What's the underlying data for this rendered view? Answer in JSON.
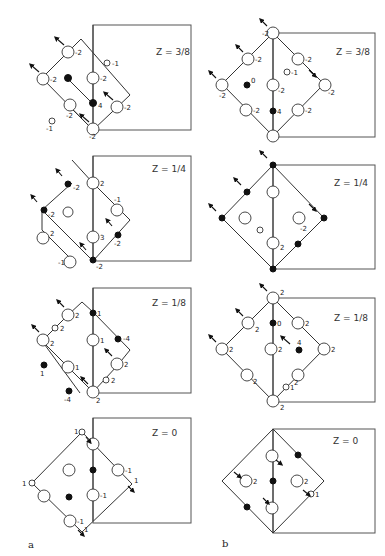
{
  "figure": {
    "panel_labels": [
      "a",
      "b"
    ],
    "panels": {
      "a": [
        {
          "z_label": "Z = 3/8",
          "level": "3/8",
          "open_site_values": [
            "-2",
            "-2",
            "-2",
            "-2",
            "-2",
            "-2",
            "-1",
            "-1"
          ],
          "filled_site_values": [
            "4"
          ]
        },
        {
          "z_label": "Z = 1/4",
          "level": "1/4",
          "open_site_values": [
            "2",
            "2",
            "3",
            "-1",
            "-1"
          ],
          "filled_site_values": [
            "-2",
            "-2",
            "-2",
            "-2"
          ]
        },
        {
          "z_label": "Z = 1/8",
          "level": "1/8",
          "open_site_values": [
            "2",
            "2",
            "2",
            "1",
            "1",
            "2",
            "2"
          ],
          "filled_site_values": [
            "1",
            "-4",
            "-4"
          ]
        },
        {
          "z_label": "Z = 0",
          "level": "0",
          "open_site_values": [
            "-1",
            "-1",
            "-1",
            "1",
            "1"
          ],
          "filled_site_values": []
        }
      ],
      "b": [
        {
          "z_label": "Z = 3/8",
          "level": "3/8",
          "open_site_values": [
            "-2",
            "-2",
            "-2",
            "-2",
            "-2",
            "-2",
            "-2",
            "-2",
            "-1"
          ],
          "filled_site_values": [
            "0",
            "4"
          ]
        },
        {
          "z_label": "Z = 1/4",
          "level": "1/4",
          "open_site_values": [
            "-2",
            "2"
          ],
          "filled_site_values": []
        },
        {
          "z_label": "Z = 1/8",
          "level": "1/8",
          "open_site_values": [
            "2",
            "2",
            "2",
            "2",
            "2",
            "2",
            "2",
            "2",
            "1"
          ],
          "filled_site_values": [
            "0",
            "4"
          ]
        },
        {
          "z_label": "Z = 0",
          "level": "0",
          "open_site_values": [
            "2",
            "2",
            "1"
          ],
          "filled_site_values": []
        }
      ]
    }
  }
}
